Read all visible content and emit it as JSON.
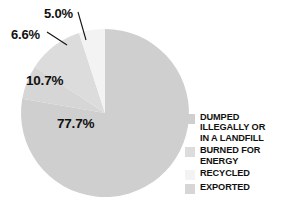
{
  "chart_data": {
    "type": "pie",
    "title": "",
    "categories": [
      "DUMPED ILLEGALLY OR IN A LANDFILL",
      "BURNED FOR ENERGY",
      "RECYCLED",
      "EXPORTED"
    ],
    "values": [
      77.7,
      10.7,
      5.0,
      6.6
    ],
    "value_labels": [
      "77.7%",
      "10.7%",
      "5.0%",
      "6.6%"
    ],
    "units": "percent",
    "legend_position": "right",
    "grid": false,
    "colors": [
      "#cfcfcf",
      "#dcdcdc",
      "#f3f3f3",
      "#d6d6d6"
    ],
    "background": "#ffffff",
    "label_color": "#111111"
  },
  "labels": [
    {
      "id": "dumped",
      "text": "77.7%",
      "placement": "inside"
    },
    {
      "id": "burned",
      "text": "10.7%",
      "placement": "inside"
    },
    {
      "id": "recycled",
      "text": "6.6%",
      "placement": "outside-leader"
    },
    {
      "id": "exported",
      "text": "5.0%",
      "placement": "outside-leader"
    }
  ],
  "legend": {
    "items": [
      {
        "swatch_color": "#cfcfcf",
        "lines": [
          "DUMPED",
          "ILLEGALLY OR",
          "IN A LANDFILL"
        ]
      },
      {
        "swatch_color": "#dcdcdc",
        "lines": [
          "BURNED FOR",
          "ENERGY"
        ]
      },
      {
        "swatch_color": "#f3f3f3",
        "lines": [
          "RECYCLED"
        ]
      },
      {
        "swatch_color": "#d6d6d6",
        "lines": [
          "EXPORTED"
        ]
      }
    ]
  }
}
